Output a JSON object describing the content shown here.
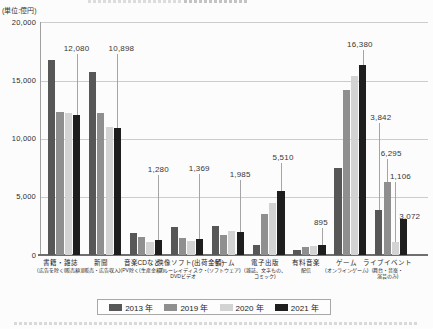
{
  "page": {
    "unit_label": "(単位:億円)"
  },
  "legend": {
    "items": [
      {
        "label": "2013 年",
        "color": "#575757"
      },
      {
        "label": "2019 年",
        "color": "#8f8f8f"
      },
      {
        "label": "2020 年",
        "color": "#d3d3d3"
      },
      {
        "label": "2021 年",
        "color": "#1e1e1e"
      }
    ]
  },
  "y_axis": {
    "ticks": [
      {
        "value": 20000,
        "label": "20,000"
      },
      {
        "value": 15000,
        "label": "15,000"
      },
      {
        "value": 10000,
        "label": "10,000"
      },
      {
        "value": 5000,
        "label": "5,000"
      },
      {
        "value": 0,
        "label": "0"
      }
    ]
  },
  "chart_data": {
    "type": "bar",
    "unit": "億円",
    "ylabel": "(単位:億円)",
    "ylim": [
      0,
      20000
    ],
    "ytick_interval": 5000,
    "grid": true,
    "legend_position": "bottom",
    "categories": [
      {
        "label_lines": [
          "書籍・雑誌",
          "(広告を除く(販売額))"
        ]
      },
      {
        "label_lines": [
          "新聞",
          "(販売・広告収入)"
        ]
      },
      {
        "label_lines": [
          "音楽CDなど",
          "(PV除く(生産金額))"
        ]
      },
      {
        "label_lines": [
          "映像ソフト(出荷金額)",
          "ブルーレイディスク・",
          "DVDビデオ"
        ]
      },
      {
        "label_lines": [
          "ゲーム",
          "(ソフトウェア)"
        ]
      },
      {
        "label_lines": [
          "電子出版",
          "(雑誌、文字もの、",
          "コミック)"
        ]
      },
      {
        "label_lines": [
          "有料音楽",
          "配信"
        ]
      },
      {
        "label_lines": [
          "ゲーム",
          "(オンラインゲーム)"
        ]
      },
      {
        "label_lines": [
          "ライブイベント",
          "(舞台・音楽・",
          "演芸のみ)"
        ]
      }
    ],
    "series": [
      {
        "name": "2013 年",
        "color": "#575757",
        "values": [
          16800,
          15700,
          1900,
          2400,
          2500,
          850,
          420,
          7500,
          3842
        ]
      },
      {
        "name": "2019 年",
        "color": "#8f8f8f",
        "values": [
          12300,
          12200,
          1580,
          1450,
          1750,
          3500,
          700,
          14200,
          6295
        ]
      },
      {
        "name": "2020 年",
        "color": "#d3d3d3",
        "values": [
          12200,
          11000,
          1100,
          1200,
          2050,
          4500,
          780,
          15400,
          1106
        ]
      },
      {
        "name": "2021 年",
        "color": "#1e1e1e",
        "values": [
          12080,
          10898,
          1280,
          1369,
          1985,
          5510,
          895,
          16380,
          3072
        ]
      }
    ],
    "annotations": [
      {
        "category": 0,
        "series": 3,
        "label": "12,080"
      },
      {
        "category": 1,
        "series": 3,
        "label": "10,898"
      },
      {
        "category": 2,
        "series": 3,
        "label": "1,280"
      },
      {
        "category": 3,
        "series": 3,
        "label": "1,369"
      },
      {
        "category": 4,
        "series": 3,
        "label": "1,985"
      },
      {
        "category": 5,
        "series": 3,
        "label": "5,510"
      },
      {
        "category": 6,
        "series": 3,
        "label": "895"
      },
      {
        "category": 7,
        "series": 3,
        "label": "16,380"
      },
      {
        "category": 8,
        "series": 0,
        "label": "3,842"
      },
      {
        "category": 8,
        "series": 1,
        "label": "6,295"
      },
      {
        "category": 8,
        "series": 2,
        "label": "1,106"
      },
      {
        "category": 8,
        "series": 3,
        "label": "3,072"
      }
    ]
  }
}
